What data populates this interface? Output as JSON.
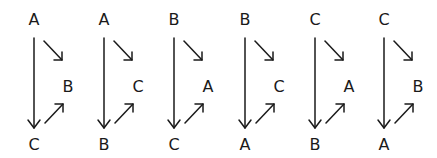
{
  "colors": {
    "ink": "#1a1a1a",
    "background": "#ffffff"
  },
  "diagrams": [
    {
      "top": "A",
      "right": "B",
      "bottom": "C"
    },
    {
      "top": "A",
      "right": "C",
      "bottom": "B"
    },
    {
      "top": "B",
      "right": "A",
      "bottom": "C"
    },
    {
      "top": "B",
      "right": "C",
      "bottom": "A"
    },
    {
      "top": "C",
      "right": "A",
      "bottom": "B"
    },
    {
      "top": "C",
      "right": "B",
      "bottom": "A"
    }
  ]
}
